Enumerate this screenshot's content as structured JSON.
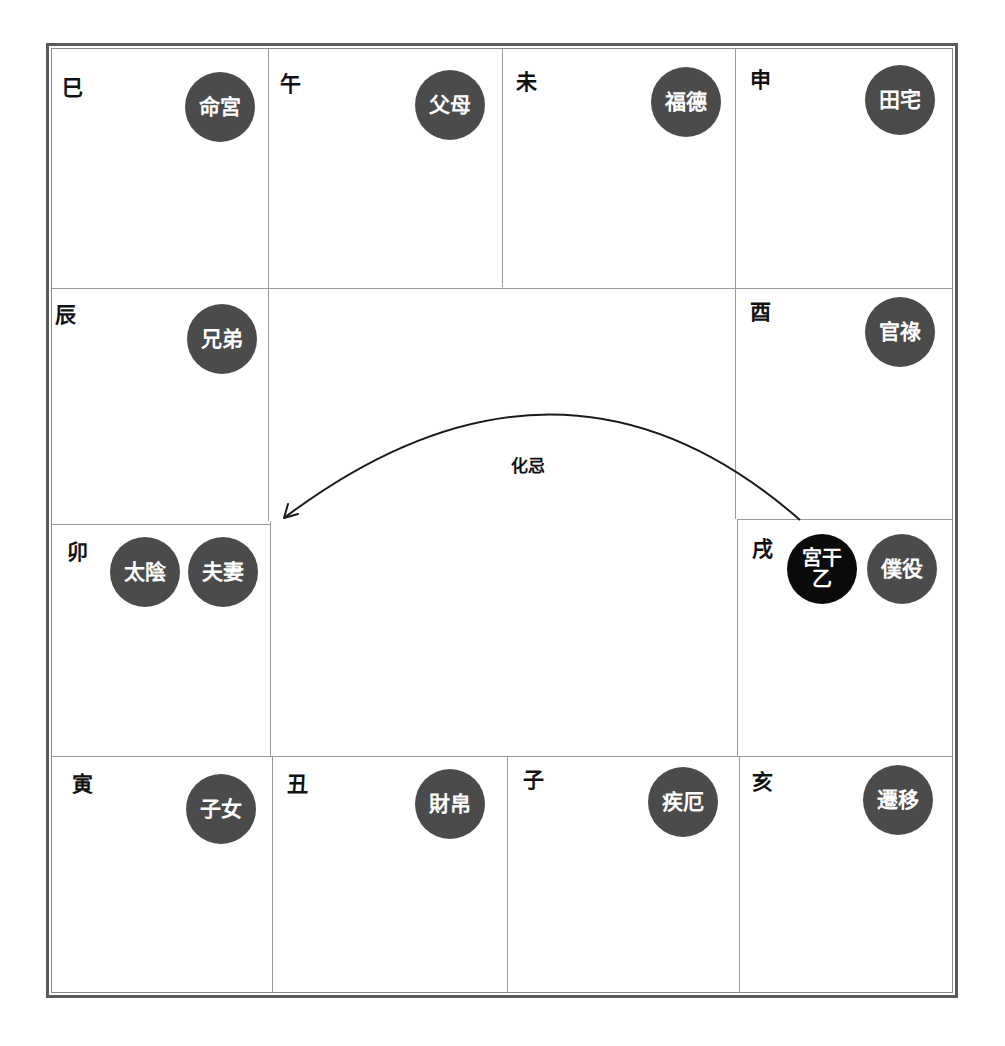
{
  "diagram": {
    "palaces": [
      {
        "branch": "巳",
        "palace": "命宮",
        "position": "top-1"
      },
      {
        "branch": "午",
        "palace": "父母",
        "position": "top-2"
      },
      {
        "branch": "未",
        "palace": "福德",
        "position": "top-3"
      },
      {
        "branch": "申",
        "palace": "田宅",
        "position": "top-4"
      },
      {
        "branch": "辰",
        "palace": "兄弟",
        "position": "left-2"
      },
      {
        "branch": "酉",
        "palace": "官祿",
        "position": "right-2"
      },
      {
        "branch": "卯",
        "palace": "夫妻",
        "star": "太陰",
        "position": "left-3"
      },
      {
        "branch": "戌",
        "palace": "僕役",
        "stem_label": "宮干",
        "stem": "乙",
        "position": "right-3"
      },
      {
        "branch": "寅",
        "palace": "子女",
        "position": "bottom-1"
      },
      {
        "branch": "丑",
        "palace": "財帛",
        "position": "bottom-2"
      },
      {
        "branch": "子",
        "palace": "疾厄",
        "position": "bottom-3"
      },
      {
        "branch": "亥",
        "palace": "遷移",
        "position": "bottom-4"
      }
    ],
    "arrow": {
      "label": "化忌",
      "from": "戌",
      "to": "卯"
    },
    "colors": {
      "badge_fill": "#4b4b4b",
      "stem_badge_fill": "#0a0a0a",
      "badge_text": "#ffffff",
      "border": "#5a5a5a",
      "grid_line": "#9a9a9a"
    }
  }
}
